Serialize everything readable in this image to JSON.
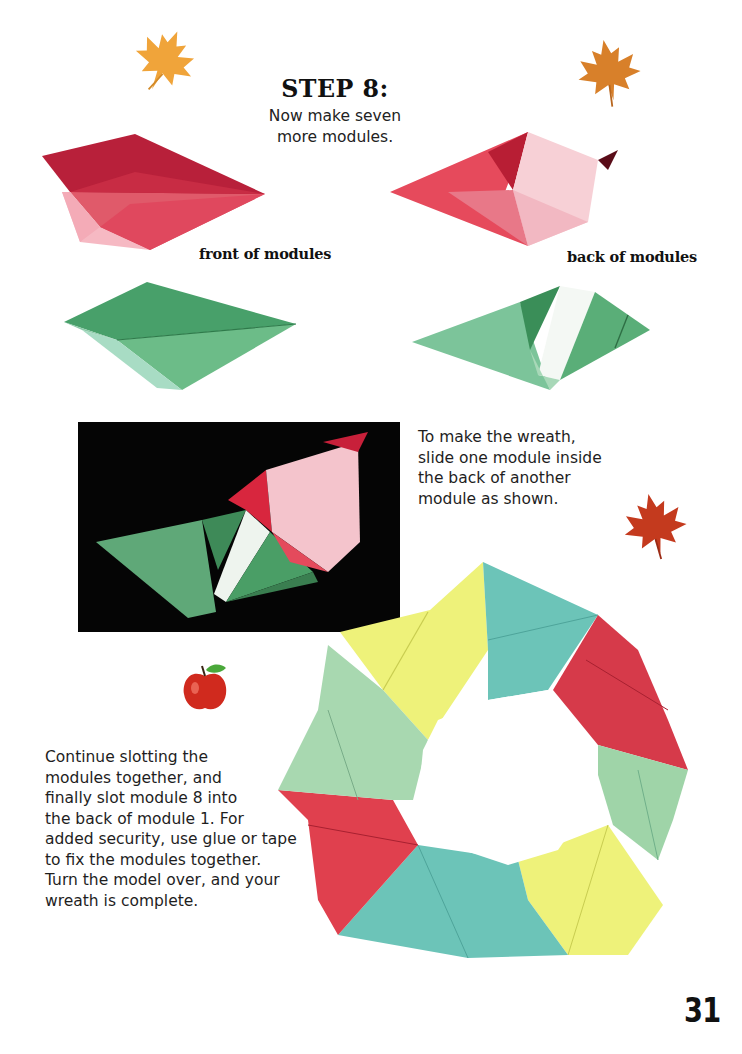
{
  "page": {
    "step_title": "STEP 8:",
    "step_subtitle_line1": "Now make seven",
    "step_subtitle_line2": "more modules.",
    "captions": {
      "front": "front of modules",
      "back": "back of modules"
    },
    "instructions": {
      "wreath_intro": [
        "To make the wreath,",
        "slide one module inside",
        "the back of another",
        "module as shown."
      ],
      "continue": [
        "Continue slotting the",
        "modules together, and",
        "finally slot module 8 into",
        "the back of module 1. For",
        "added security, use glue or tape",
        "to fix the modules together.",
        "Turn the model over, and your",
        "wreath is complete."
      ]
    },
    "page_number": "31"
  },
  "images": {
    "front_module_red": "red-paper-module-front",
    "back_module_red": "red-paper-module-back",
    "front_module_green": "green-paper-module-front",
    "back_module_green": "green-paper-module-back",
    "assembly_photo": "two-modules-slotted-photo",
    "wreath": "eight-module-origami-wreath"
  },
  "decorations": [
    "maple-leaf-yellow",
    "maple-leaf-orange",
    "maple-leaf-red",
    "apple"
  ],
  "colors": {
    "red": "#d63a4a",
    "pink": "#f2b8c2",
    "green": "#5fae7c",
    "mint": "#a8d8b0",
    "teal": "#6cc4b8",
    "yellow": "#eef27a",
    "leaf_yellow": "#f0a43a",
    "leaf_orange": "#d8802a",
    "leaf_red": "#c43a1e",
    "photo_bg": "#050505"
  }
}
